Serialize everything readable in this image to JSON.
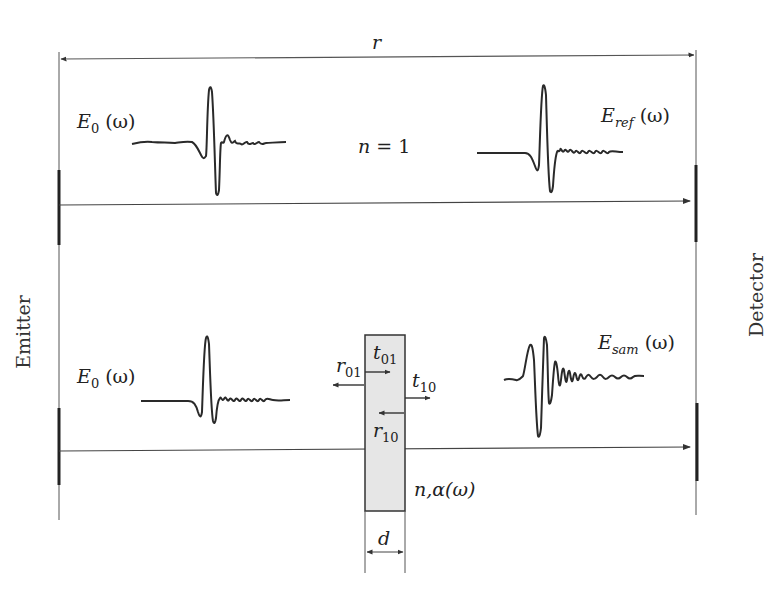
{
  "diagram": {
    "distance_label": "r",
    "emitter_label": "Emitter",
    "detector_label": "Detector",
    "reference_path": {
      "medium_label": "n = 1",
      "input_field": {
        "symbol": "E",
        "subscript": "0",
        "argument": "(ω)"
      },
      "output_field": {
        "symbol": "E",
        "subscript": "ref",
        "argument": "(ω)"
      }
    },
    "sample_path": {
      "input_field": {
        "symbol": "E",
        "subscript": "0",
        "argument": "(ω)"
      },
      "output_field": {
        "symbol": "E",
        "subscript": "sam",
        "argument": "(ω)"
      },
      "sample": {
        "properties_label": "n,α(ω)",
        "thickness_label": "d",
        "coefficients": [
          {
            "symbol": "r",
            "subscript": "01"
          },
          {
            "symbol": "t",
            "subscript": "01"
          },
          {
            "symbol": "t",
            "subscript": "10"
          },
          {
            "symbol": "r",
            "subscript": "10"
          }
        ]
      }
    },
    "colors": {
      "line": "#3a3a3a",
      "bold_line": "#222222",
      "sample_fill": "#e6e6e6",
      "text": "#222222"
    }
  }
}
